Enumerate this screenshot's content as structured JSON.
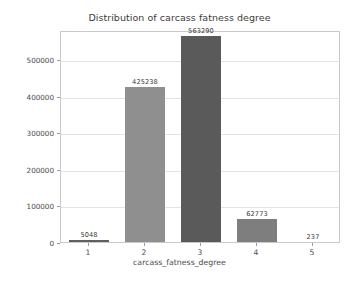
{
  "chart_data": {
    "type": "bar",
    "title": "Distribution of carcass fatness degree",
    "xlabel": "carcass_fatness_degree",
    "ylabel": "count",
    "categories": [
      "1",
      "2",
      "3",
      "4",
      "5"
    ],
    "values": [
      5048,
      425238,
      563290,
      62773,
      237
    ],
    "value_labels": [
      "5048",
      "425238",
      "563290",
      "62773",
      "237"
    ],
    "bar_colors": [
      "#5f5f5f",
      "#8f8f8f",
      "#5a5a5a",
      "#7e7e7e",
      "#ffffff"
    ],
    "ylim": [
      0,
      580000
    ],
    "yticks": [
      0,
      100000,
      200000,
      300000,
      400000,
      500000
    ],
    "ytick_labels": [
      "0",
      "100000",
      "200000",
      "300000",
      "400000",
      "500000"
    ],
    "xtick_labels": [
      "1",
      "2",
      "3",
      "4",
      "5"
    ],
    "grid": true,
    "grid_color": "#e3e3e3",
    "legend": "none",
    "axes_color": "#c9c9c9",
    "text_color": "#4a4a4a",
    "background": "#ffffff"
  }
}
